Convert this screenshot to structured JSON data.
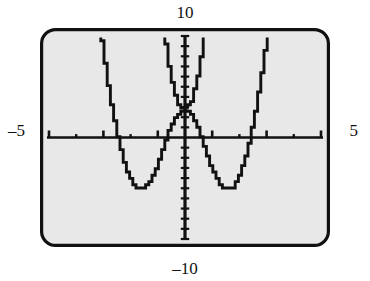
{
  "figure": {
    "kind": "graphing-calculator-screen",
    "screen": {
      "background_color": "#e8e8e8",
      "border_color": "#111111",
      "curve_color": "#111111",
      "axis_color": "#111111",
      "corner_radius": 14
    }
  },
  "labels": {
    "top": "10",
    "bottom": "–10",
    "left": "–5",
    "right": "5"
  },
  "chart_data": {
    "type": "line",
    "title": "",
    "xlabel": "",
    "ylabel": "",
    "xlim": [
      -5,
      5
    ],
    "ylim": [
      -10,
      10
    ],
    "grid": false,
    "legend": false,
    "axis_ticks": {
      "x_tick_spacing": 1,
      "y_tick_spacing": 1,
      "x_ticks": [
        -5,
        -4,
        -3,
        -2,
        -1,
        0,
        1,
        2,
        3,
        4,
        5
      ],
      "y_ticks": [
        -10,
        -9,
        -8,
        -7,
        -6,
        -5,
        -4,
        -3,
        -2,
        -1,
        0,
        1,
        2,
        3,
        4,
        5,
        6,
        7,
        8,
        9,
        10
      ]
    },
    "annotations": [
      "top label 10 marks the y-axis maximum",
      "bottom label -10 marks the y-axis minimum",
      "left label -5 marks the x-axis minimum",
      "right label 5 marks the x-axis maximum"
    ],
    "series": [
      {
        "name": "quartic W-curve",
        "color": "#111111",
        "description": "W-shaped quartic with local maximum near x=0 and two minima near x=-1.8 and x=1.8",
        "x": [
          -3.05,
          -2.9,
          -2.75,
          -2.6,
          -2.45,
          -2.3,
          -2.15,
          -2.0,
          -1.85,
          -1.7,
          -1.55,
          -1.4,
          -1.25,
          -1.1,
          -0.95,
          -0.8,
          -0.65,
          -0.5,
          -0.35,
          -0.2,
          0.0,
          0.2,
          0.35,
          0.5,
          0.65,
          0.8,
          0.95,
          1.1,
          1.25,
          1.4,
          1.55,
          1.7,
          1.85,
          2.0,
          2.15,
          2.3,
          2.45,
          2.6,
          2.75,
          2.9,
          3.05
        ],
        "y": [
          10.0,
          7.2,
          4.6,
          2.3,
          0.25,
          -1.5,
          -2.9,
          -4.0,
          -4.7,
          -5.05,
          -5.1,
          -4.85,
          -4.3,
          -3.5,
          -2.5,
          -1.35,
          -0.15,
          0.95,
          1.85,
          2.4,
          2.6,
          2.4,
          1.85,
          0.95,
          -0.15,
          -1.35,
          -2.5,
          -3.5,
          -4.3,
          -4.85,
          -5.1,
          -5.05,
          -4.7,
          -4.0,
          -2.9,
          -1.5,
          0.25,
          2.3,
          4.6,
          7.2,
          10.0
        ]
      },
      {
        "name": "narrow upward parabola",
        "color": "#111111",
        "description": "Steep narrow upward-opening curve with vertex near (0, 3.0)",
        "x": [
          -0.72,
          -0.64,
          -0.56,
          -0.48,
          -0.4,
          -0.32,
          -0.24,
          -0.16,
          -0.08,
          0.0,
          0.08,
          0.16,
          0.24,
          0.32,
          0.4,
          0.48,
          0.56,
          0.64,
          0.72
        ],
        "y": [
          10.0,
          8.5,
          7.1,
          5.9,
          4.9,
          4.1,
          3.5,
          3.15,
          3.02,
          3.0,
          3.02,
          3.15,
          3.5,
          4.1,
          4.9,
          5.9,
          7.1,
          8.5,
          10.0
        ]
      }
    ]
  }
}
